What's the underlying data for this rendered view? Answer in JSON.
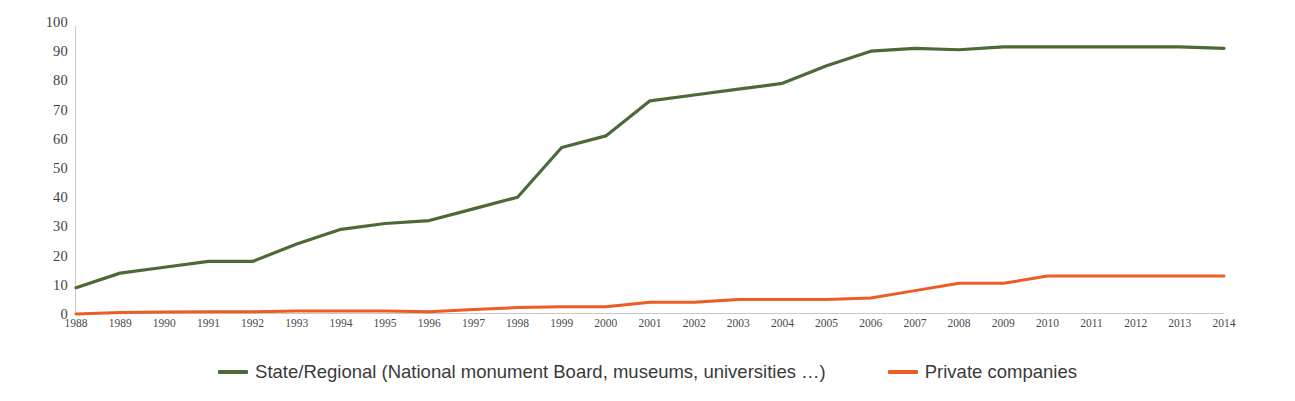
{
  "chart_data": {
    "type": "line",
    "title": "",
    "subtitle": "",
    "xlabel": "",
    "ylabel": "",
    "ylim": [
      0,
      100
    ],
    "ytick_step": 10,
    "yticks": [
      0,
      10,
      20,
      30,
      40,
      50,
      60,
      70,
      80,
      90,
      100
    ],
    "grid": false,
    "legend_position": "bottom-center",
    "x": [
      1988,
      1989,
      1990,
      1991,
      1992,
      1993,
      1994,
      1995,
      1996,
      1997,
      1998,
      1999,
      2000,
      2001,
      2002,
      2003,
      2004,
      2005,
      2006,
      2007,
      2008,
      2009,
      2010,
      2011,
      2012,
      2013,
      2014
    ],
    "categories": [
      "1988",
      "1989",
      "1990",
      "1991",
      "1992",
      "1993",
      "1994",
      "1995",
      "1996",
      "1997",
      "1998",
      "1999",
      "2000",
      "2001",
      "2002",
      "2003",
      "2004",
      "2005",
      "2006",
      "2007",
      "2008",
      "2009",
      "2010",
      "2011",
      "2012",
      "2013",
      "2014"
    ],
    "series": [
      {
        "name": "State/Regional (National monument Board, museums, universities …)",
        "color": "#4B6A35",
        "values": [
          9,
          14,
          16,
          18,
          18,
          24,
          29,
          31,
          32,
          36,
          40,
          57,
          61,
          73,
          75,
          77,
          79,
          85,
          90,
          91,
          90.5,
          91.5,
          91.5,
          91.5,
          91.5,
          91.5,
          91
        ]
      },
      {
        "name": "Private companies",
        "color": "#ED5C22",
        "values": [
          0,
          0.5,
          0.7,
          0.8,
          0.8,
          1,
          1,
          1,
          0.8,
          1.5,
          2.2,
          2.5,
          2.5,
          4,
          4,
          5,
          5,
          5,
          5.5,
          8,
          10.5,
          10.5,
          13,
          13,
          13,
          13,
          13
        ]
      }
    ]
  },
  "legend": {
    "items": [
      {
        "label": "State/Regional (National monument Board, museums, universities …)",
        "color": "#4B6A35"
      },
      {
        "label": "Private companies",
        "color": "#ED5C22"
      }
    ]
  },
  "axes": {
    "y": {
      "ticks": [
        "0",
        "10",
        "20",
        "30",
        "40",
        "50",
        "60",
        "70",
        "80",
        "90",
        "100"
      ]
    },
    "x": {
      "ticks": [
        "1988",
        "1989",
        "1990",
        "1991",
        "1992",
        "1993",
        "1994",
        "1995",
        "1996",
        "1997",
        "1998",
        "1999",
        "2000",
        "2001",
        "2002",
        "2003",
        "2004",
        "2005",
        "2006",
        "2007",
        "2008",
        "2009",
        "2010",
        "2011",
        "2012",
        "2013",
        "2014"
      ]
    }
  },
  "colors": {
    "background": "#ffffff",
    "axis_line": "#c9c9c9",
    "tick_text": "#4a4a4a",
    "series_state_regional": "#4B6A35",
    "series_private": "#ED5C22"
  }
}
